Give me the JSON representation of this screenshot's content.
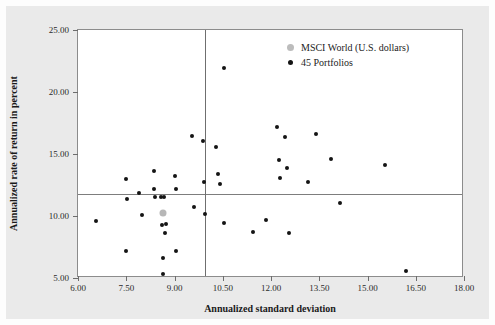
{
  "chart_data": {
    "type": "scatter",
    "title": "",
    "xlabel": "Annualized standard deviation",
    "ylabel": "Annualized rate of return in percent",
    "xlim": [
      6.0,
      18.0
    ],
    "ylim": [
      5.0,
      25.0
    ],
    "xticks": [
      "6.00",
      "7.50",
      "9.00",
      "10.50",
      "12.00",
      "13.50",
      "15.00",
      "16.50",
      "18.00"
    ],
    "xtick_values": [
      6.0,
      7.5,
      9.0,
      10.5,
      12.0,
      13.5,
      15.0,
      16.5,
      18.0
    ],
    "yticks": [
      "5.00",
      "10.00",
      "15.00",
      "20.00",
      "25.00"
    ],
    "ytick_values": [
      5.0,
      10.0,
      15.0,
      20.0,
      25.0
    ],
    "grid": false,
    "legend_position": "top-right",
    "colors": {
      "portfolio_marker": "#141414",
      "msci_marker": "#b7b7b7",
      "reference_line": "#7d7d7d",
      "axis": "#8c8c8c",
      "plot_background": "#ffffff",
      "page_background": "#eaeaea"
    },
    "reference_lines": {
      "vertical_x": 9.95,
      "horizontal_y": 11.8
    },
    "series": [
      {
        "name": "MSCI World (U.S. dollars)",
        "marker": "large-gray-dot",
        "points": [
          {
            "x": 8.65,
            "y": 10.25
          }
        ]
      },
      {
        "name": "45 Portfolios",
        "marker": "small-black-dot",
        "points": [
          {
            "x": 6.55,
            "y": 9.6
          },
          {
            "x": 7.48,
            "y": 13.0
          },
          {
            "x": 7.5,
            "y": 7.2
          },
          {
            "x": 7.53,
            "y": 11.4
          },
          {
            "x": 7.9,
            "y": 11.85
          },
          {
            "x": 8.0,
            "y": 10.05
          },
          {
            "x": 8.35,
            "y": 13.65
          },
          {
            "x": 8.35,
            "y": 12.15
          },
          {
            "x": 8.4,
            "y": 11.5
          },
          {
            "x": 8.58,
            "y": 11.5
          },
          {
            "x": 8.62,
            "y": 9.25
          },
          {
            "x": 8.63,
            "y": 6.6
          },
          {
            "x": 8.64,
            "y": 5.3
          },
          {
            "x": 8.68,
            "y": 11.5
          },
          {
            "x": 8.7,
            "y": 8.6
          },
          {
            "x": 8.75,
            "y": 9.35
          },
          {
            "x": 9.0,
            "y": 13.2
          },
          {
            "x": 9.05,
            "y": 12.2
          },
          {
            "x": 9.05,
            "y": 7.15
          },
          {
            "x": 9.55,
            "y": 16.45
          },
          {
            "x": 9.6,
            "y": 10.75
          },
          {
            "x": 9.9,
            "y": 16.05
          },
          {
            "x": 9.92,
            "y": 12.75
          },
          {
            "x": 9.95,
            "y": 10.2
          },
          {
            "x": 10.3,
            "y": 15.6
          },
          {
            "x": 10.35,
            "y": 13.4
          },
          {
            "x": 10.4,
            "y": 12.6
          },
          {
            "x": 10.55,
            "y": 21.9
          },
          {
            "x": 10.55,
            "y": 9.4
          },
          {
            "x": 11.45,
            "y": 8.75
          },
          {
            "x": 11.85,
            "y": 9.7
          },
          {
            "x": 12.2,
            "y": 17.15
          },
          {
            "x": 12.25,
            "y": 14.5
          },
          {
            "x": 12.28,
            "y": 13.1
          },
          {
            "x": 12.45,
            "y": 16.4
          },
          {
            "x": 12.5,
            "y": 13.85
          },
          {
            "x": 12.55,
            "y": 8.65
          },
          {
            "x": 13.15,
            "y": 12.75
          },
          {
            "x": 13.4,
            "y": 16.65
          },
          {
            "x": 13.85,
            "y": 14.6
          },
          {
            "x": 14.15,
            "y": 11.05
          },
          {
            "x": 15.55,
            "y": 14.1
          },
          {
            "x": 16.2,
            "y": 5.6
          }
        ]
      }
    ]
  },
  "legend": {
    "items": [
      {
        "label": "MSCI World (U.S. dollars)",
        "marker": "gray"
      },
      {
        "label": "45 Portfolios",
        "marker": "black"
      }
    ]
  }
}
